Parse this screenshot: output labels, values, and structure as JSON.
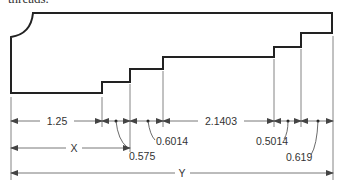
{
  "caption": "threads.",
  "diagram": {
    "type": "stepped-shaft-profile",
    "dimensions": {
      "d1": "1.25",
      "d2": "0.575",
      "d3": "0.6014",
      "d4": "2.1403",
      "d5": "0.5014",
      "d6": "0.619",
      "x": "X",
      "y": "Y"
    },
    "colors": {
      "line": "#222222",
      "dim": "#555555",
      "text": "#333333"
    }
  }
}
